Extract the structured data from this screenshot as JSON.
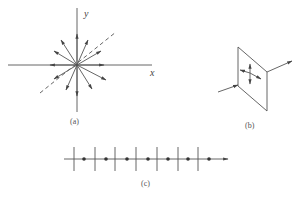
{
  "figure": {
    "panels": [
      {
        "id": "a",
        "caption": "(a)",
        "description": "Unpolarized light: arrows radiating in all directions in the x-y plane",
        "axis_x": "x",
        "axis_y": "y"
      },
      {
        "id": "b",
        "caption": "(b)",
        "description": "Light ray passing through a plane with vibration arrows in all directions"
      },
      {
        "id": "c",
        "caption": "(c)",
        "description": "Ray with alternating perpendicular ticks and dots along propagation"
      }
    ],
    "colors": {
      "line": "#555555",
      "background": "#ffffff"
    }
  }
}
